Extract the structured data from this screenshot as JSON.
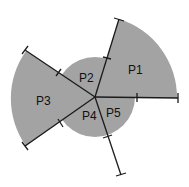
{
  "diagram": {
    "center": [
      95,
      97
    ],
    "small_radius": 40,
    "large_radius": 82,
    "fill_color": "#a3a3a3",
    "line_color": "#1a1a1a",
    "regions": [
      {
        "id": "P1",
        "label": "P1",
        "label_pos": [
          130,
          74
        ]
      },
      {
        "id": "P2",
        "label": "P2",
        "label_pos": [
          80,
          82
        ]
      },
      {
        "id": "P3",
        "label": "P3",
        "label_pos": [
          37,
          105
        ]
      },
      {
        "id": "P4",
        "label": "P4",
        "label_pos": [
          83,
          120
        ]
      },
      {
        "id": "P5",
        "label": "P5",
        "label_pos": [
          107,
          116
        ]
      }
    ]
  }
}
